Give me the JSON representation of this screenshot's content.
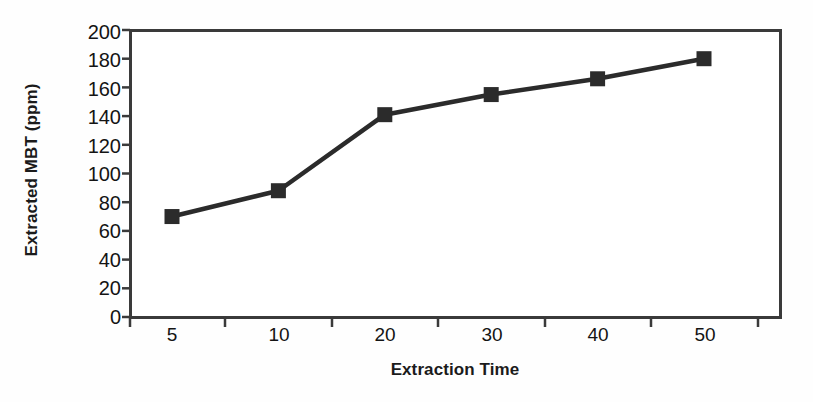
{
  "chart_data": {
    "type": "line",
    "title": "",
    "subtitle": "",
    "xlabel": "Extraction Time",
    "ylabel": "Extracted MBT (ppm)",
    "categories": [
      "5",
      "10",
      "20",
      "30",
      "40",
      "50"
    ],
    "values": [
      70,
      88,
      141,
      155,
      166,
      180
    ],
    "series": [
      {
        "name": "Extracted MBT",
        "values": [
          70,
          88,
          141,
          155,
          166,
          180
        ],
        "marker": "square",
        "color": "#2b2b2b"
      }
    ],
    "ylim": [
      0,
      200
    ],
    "ytick_labels": [
      "0",
      "20",
      "40",
      "60",
      "80",
      "100",
      "120",
      "140",
      "160",
      "180",
      "200"
    ],
    "ytick_values": [
      0,
      20,
      40,
      60,
      80,
      100,
      120,
      140,
      160,
      180,
      200
    ],
    "xtick_labels": [
      "5",
      "10",
      "20",
      "30",
      "40",
      "50"
    ],
    "grid": false,
    "legend": false,
    "legend_position": "none",
    "line_color": "#2b2b2b",
    "marker_color": "#2b2b2b",
    "axis_color": "#3a3a3a",
    "background_color": "#ffffff",
    "annotations": []
  }
}
